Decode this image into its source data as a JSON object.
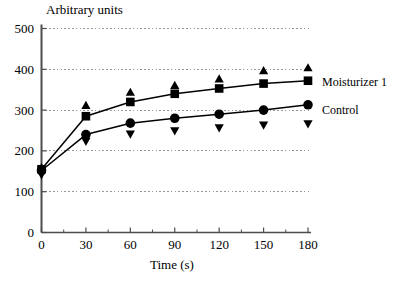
{
  "chart_data": {
    "type": "line",
    "title": "",
    "ylabel": "Arbitrary units",
    "xlabel": "Time (s)",
    "x": [
      0,
      30,
      60,
      90,
      120,
      150,
      180
    ],
    "xlim": [
      0,
      180
    ],
    "ylim": [
      0,
      500
    ],
    "xticks": [
      "0",
      "30",
      "60",
      "90",
      "120",
      "150",
      "180"
    ],
    "yticks": [
      "0",
      "100",
      "200",
      "300",
      "400",
      "500"
    ],
    "grid": true,
    "legend_position": "right",
    "series": [
      {
        "name": "Moisturizer 1",
        "marker": "square",
        "values": [
          155,
          285,
          320,
          340,
          353,
          365,
          372
        ]
      },
      {
        "name": "Control",
        "marker": "circle",
        "values": [
          152,
          240,
          268,
          280,
          290,
          300,
          313
        ]
      },
      {
        "name": "Moisturizer 1 upper error",
        "marker": "triangle-up",
        "values": [
          160,
          313,
          345,
          362,
          378,
          398,
          405
        ]
      },
      {
        "name": "Control lower error",
        "marker": "triangle-down",
        "values": [
          140,
          222,
          240,
          248,
          255,
          262,
          265
        ]
      }
    ]
  },
  "legend": {
    "moisturizer_label": "Moisturizer 1",
    "control_label": "Control"
  },
  "colors": {
    "ink": "#000000",
    "grid": "#8c8c8c",
    "axis": "#4d4d4d",
    "background": "#ffffff"
  }
}
